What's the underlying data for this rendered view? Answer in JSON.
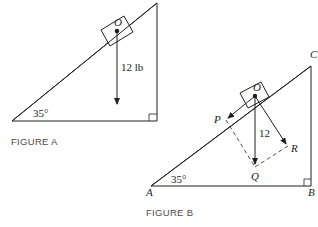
{
  "figure_a": {
    "caption": "FIGURE A",
    "angle_label": "35°",
    "point_label": "O",
    "force_label": "12 lb"
  },
  "figure_b": {
    "caption": "FIGURE B",
    "angle_label": "35°",
    "point_labels": {
      "O": "O",
      "P": "P",
      "Q": "Q",
      "R": "R",
      "A": "A",
      "B": "B",
      "C": "C"
    },
    "force_label": "12"
  },
  "colors": {
    "line": "#231f20",
    "background": "#ffffff"
  }
}
